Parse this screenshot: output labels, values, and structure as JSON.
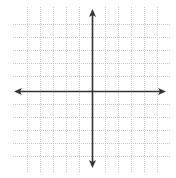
{
  "diagram": {
    "type": "coordinate-plane",
    "grid": {
      "color": "#c8c8c8",
      "style": "dotted",
      "vertical_lines_x": [
        27,
        40,
        53,
        66,
        79,
        105,
        118,
        131,
        144,
        157
      ],
      "horizontal_lines_y": [
        24,
        37,
        50,
        63,
        76,
        104,
        117,
        130,
        143,
        156
      ],
      "vertical_span": [
        7,
        172
      ],
      "horizontal_span": [
        13,
        170
      ]
    },
    "axes": {
      "color": "#333333",
      "x_axis": {
        "y": 91,
        "from_x": 14,
        "to_x": 166,
        "arrows": "both"
      },
      "y_axis": {
        "x": 92,
        "from_y": 9,
        "to_y": 168,
        "arrows": "both"
      }
    },
    "labels": []
  }
}
